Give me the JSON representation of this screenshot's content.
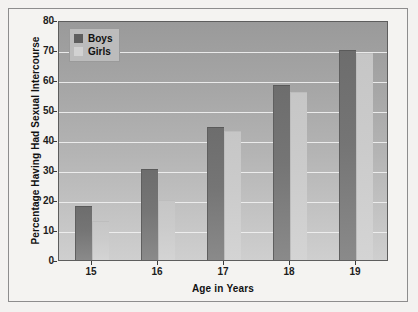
{
  "chart_data": {
    "type": "bar",
    "title": "",
    "xlabel": "Age in Years",
    "ylabel": "Percentage Having Had Sexual Intercourse",
    "categories": [
      "15",
      "16",
      "17",
      "18",
      "19"
    ],
    "series": [
      {
        "name": "Boys",
        "color": "#6d6d6d",
        "values": [
          18,
          30.5,
          44.5,
          58.5,
          70
        ]
      },
      {
        "name": "Girls",
        "color": "#cbcbcb",
        "values": [
          13,
          20,
          43,
          56,
          69
        ]
      }
    ],
    "ylim": [
      0,
      80
    ],
    "yticks": [
      "0",
      "10",
      "20",
      "30",
      "40",
      "50",
      "60",
      "70",
      "80"
    ],
    "grid": "horizontal",
    "legend_position": "top-left-inside",
    "legend_entries": [
      "Boys",
      "Girls"
    ]
  },
  "figure": {
    "background_color": "#f3f2f0",
    "plot_background_top": "#9a9a9a",
    "plot_background_bottom": "#cfcfcf",
    "gridline_color": "#f0f0f0",
    "frame_color": "#8d8d8d"
  }
}
